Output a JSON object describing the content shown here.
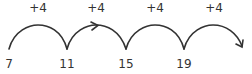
{
  "diagram": {
    "type": "number-line-jumps",
    "stroke_color": "#333333",
    "numbers": [
      {
        "value": "7",
        "x": 9
      },
      {
        "value": "11",
        "x": 67
      },
      {
        "value": "15",
        "x": 126
      },
      {
        "value": "19",
        "x": 184
      }
    ],
    "jumps": [
      {
        "label": "+4",
        "x": 38
      },
      {
        "label": "+4",
        "x": 96
      },
      {
        "label": "+4",
        "x": 155
      },
      {
        "label": "+4",
        "x": 214
      }
    ]
  }
}
